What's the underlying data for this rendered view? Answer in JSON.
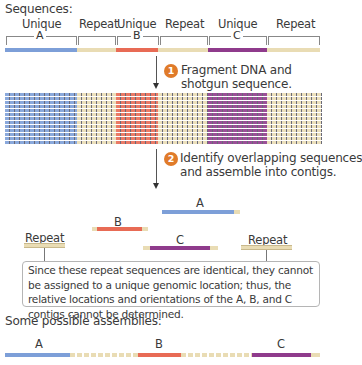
{
  "title": "Sequences:",
  "colors": {
    "unique_a": "#7d9fd8",
    "unique_b": "#e86b55",
    "unique_c": "#8f3b8c",
    "repeat": "#e9dcb4",
    "step_badge": "#e07b2a"
  },
  "sequence_labels": {
    "top": [
      "Unique",
      "Repeat",
      "Unique",
      "Repeat",
      "Unique",
      "Repeat"
    ],
    "brackets": [
      "A",
      "B",
      "C"
    ]
  },
  "steps": [
    {
      "number": "1",
      "line1": "Fragment DNA and",
      "line2": "shotgun sequence."
    },
    {
      "number": "2",
      "line1": "Identify overlapping sequences",
      "line2": "and assemble into contigs."
    }
  ],
  "contigs": {
    "a_label": "A",
    "b_label": "B",
    "c_label": "C",
    "repeat_left_label": "Repeat",
    "repeat_right_label": "Repeat"
  },
  "callout": {
    "text": "Since these repeat sequences are identical, they cannot be assigned to a unique genomic location; thus, the relative locations and orientations of the A, B, and C contigs cannot be determined."
  },
  "assemblies": {
    "heading": "Some possible assemblies:",
    "labels": [
      "A",
      "B",
      "C"
    ]
  }
}
